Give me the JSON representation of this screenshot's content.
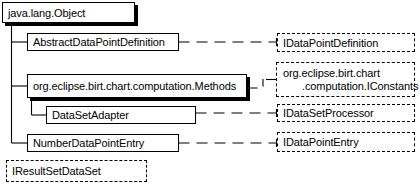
{
  "diagram": {
    "type": "uml-class-hierarchy",
    "title": "",
    "root": {
      "id": "java-lang-object",
      "label": "java.lang.Object",
      "kind": "class",
      "style": "solid-shadow"
    },
    "classes": [
      {
        "id": "abstract-data-point-definition",
        "label": "AbstractDataPointDefinition",
        "kind": "class",
        "style": "solid",
        "parent": "java.lang.Object",
        "implements": "IDataPointDefinition"
      },
      {
        "id": "org-eclipse-birt-chart-computation-methods",
        "label": "org.eclipse.birt.chart.computation.Methods",
        "kind": "class",
        "style": "solid-shadow",
        "parent": "java.lang.Object",
        "implements": "org.eclipse.birt.chart.computation.IConstants"
      },
      {
        "id": "data-set-adapter",
        "label": "DataSetAdapter",
        "kind": "class",
        "style": "solid",
        "parent": "org.eclipse.birt.chart.computation.Methods",
        "implements": "IDataSetProcessor"
      },
      {
        "id": "number-data-point-entry",
        "label": "NumberDataPointEntry",
        "kind": "class",
        "style": "solid",
        "parent": "java.lang.Object",
        "implements": "IDataPointEntry"
      }
    ],
    "interfaces": [
      {
        "id": "i-data-point-definition",
        "label": "IDataPointDefinition",
        "kind": "interface",
        "style": "dashed"
      },
      {
        "id": "i-constants",
        "label": "org.eclipse.birt.chart.computation.IConstants",
        "kind": "interface",
        "style": "dashed",
        "line1": "org.eclipse.birt.chart",
        "line2": ".computation.IConstants"
      },
      {
        "id": "i-data-set-processor",
        "label": "IDataSetProcessor",
        "kind": "interface",
        "style": "dashed"
      },
      {
        "id": "i-data-point-entry",
        "label": "IDataPointEntry",
        "kind": "interface",
        "style": "dashed"
      },
      {
        "id": "i-result-set-data-set",
        "label": "IResultSetDataSet",
        "kind": "interface",
        "style": "dashed"
      }
    ],
    "colors": {
      "stroke": "#000000",
      "fill": "#ffffff",
      "text": "#000000"
    }
  }
}
